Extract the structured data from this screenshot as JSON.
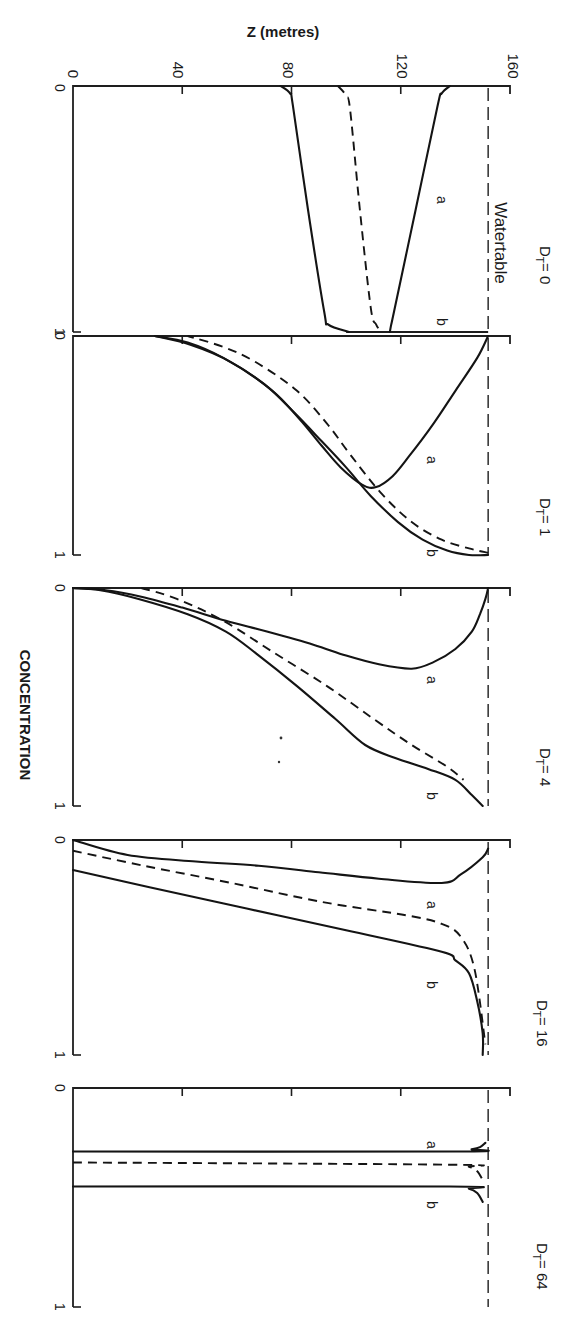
{
  "figure": {
    "z_axis_title": "Z (metres)",
    "z_ticks": [
      "0",
      "40",
      "80",
      "120",
      "160"
    ],
    "concentration_axis_title": "CONCENTRATION",
    "watertable_label": "Watertable",
    "curve_labels": {
      "a": "a",
      "b": "b"
    }
  },
  "chart_data": {
    "type": "line",
    "title": "",
    "layout": "5 stacked panels, figure rotated 90° (Z horizontal, concentration increasing downward)",
    "xlabel": "CONCENTRATION",
    "ylabel": "Z (metres)",
    "xlim": [
      0,
      1
    ],
    "ylim": [
      0,
      160
    ],
    "z_ticks": [
      0,
      40,
      80,
      120,
      160
    ],
    "concentration_ticks": [
      0,
      1
    ],
    "watertable_z": 152,
    "grid": false,
    "legend": "inline curve labels 'a' and 'b'; dashed curve unlabeled",
    "panels": [
      {
        "label": "D_T = 0",
        "label_main": "D",
        "label_sub": "T",
        "label_value": "= 0",
        "series": [
          {
            "name": "a",
            "style": "solid",
            "points": [
              [
                0,
                138
              ],
              [
                0.03,
                135
              ],
              [
                0.08,
                133.5
              ],
              [
                0.5,
                125.5
              ],
              [
                0.92,
                117.5
              ],
              [
                0.97,
                116.5
              ],
              [
                1,
                116
              ]
            ]
          },
          {
            "name": "dashed",
            "style": "dashed",
            "points": [
              [
                0,
                97
              ],
              [
                0.04,
                100
              ],
              [
                0.1,
                101.5
              ],
              [
                0.5,
                105
              ],
              [
                0.9,
                109
              ],
              [
                0.97,
                111
              ],
              [
                1,
                113
              ]
            ]
          },
          {
            "name": "b",
            "style": "solid",
            "points": [
              [
                0,
                76
              ],
              [
                0.03,
                79.5
              ],
              [
                0.08,
                80.5
              ],
              [
                0.5,
                86
              ],
              [
                0.92,
                92
              ],
              [
                0.97,
                93.5
              ],
              [
                1,
                101
              ]
            ]
          }
        ]
      },
      {
        "label": "D_T = 1",
        "label_main": "D",
        "label_sub": "T",
        "label_value": "= 1",
        "series": [
          {
            "name": "a",
            "style": "solid",
            "points": [
              [
                0,
                152
              ],
              [
                0.1,
                148
              ],
              [
                0.25,
                140
              ],
              [
                0.4,
                132
              ],
              [
                0.55,
                123
              ],
              [
                0.64,
                117
              ],
              [
                0.69,
                111
              ],
              [
                0.68,
                106
              ],
              [
                0.6,
                98
              ],
              [
                0.5,
                91
              ],
              [
                0.38,
                83
              ],
              [
                0.25,
                73
              ],
              [
                0.12,
                58
              ],
              [
                0.04,
                43
              ],
              [
                0,
                30
              ]
            ]
          },
          {
            "name": "dashed",
            "style": "dashed",
            "points": [
              [
                0.99,
                152
              ],
              [
                0.97,
                145
              ],
              [
                0.93,
                135
              ],
              [
                0.85,
                124
              ],
              [
                0.72,
                113
              ],
              [
                0.55,
                102
              ],
              [
                0.4,
                93
              ],
              [
                0.25,
                82
              ],
              [
                0.12,
                67
              ],
              [
                0.05,
                55
              ],
              [
                0,
                42
              ]
            ]
          },
          {
            "name": "b",
            "style": "solid",
            "points": [
              [
                1,
                152
              ],
              [
                1,
                145
              ],
              [
                0.98,
                137
              ],
              [
                0.93,
                128
              ],
              [
                0.85,
                119
              ],
              [
                0.73,
                109
              ],
              [
                0.6,
                100
              ],
              [
                0.48,
                91
              ],
              [
                0.35,
                81
              ],
              [
                0.22,
                70
              ],
              [
                0.1,
                55
              ],
              [
                0.03,
                42
              ],
              [
                0,
                30
              ]
            ]
          }
        ]
      },
      {
        "label": "D_T = 4",
        "label_main": "D",
        "label_sub": "T",
        "label_value": "= 4",
        "series": [
          {
            "name": "a",
            "style": "solid",
            "points": [
              [
                0,
                152
              ],
              [
                0.05,
                151
              ],
              [
                0.12,
                149
              ],
              [
                0.2,
                146
              ],
              [
                0.28,
                140
              ],
              [
                0.34,
                132
              ],
              [
                0.37,
                124
              ],
              [
                0.35,
                112
              ],
              [
                0.31,
                100
              ],
              [
                0.26,
                88
              ],
              [
                0.2,
                71
              ],
              [
                0.15,
                56
              ],
              [
                0.09,
                40
              ],
              [
                0.04,
                25
              ],
              [
                0.01,
                12
              ],
              [
                0,
                0
              ]
            ]
          },
          {
            "name": "dashed",
            "style": "dashed",
            "points": [
              [
                0,
                25
              ],
              [
                0.05,
                38
              ],
              [
                0.15,
                55
              ],
              [
                0.3,
                74
              ],
              [
                0.45,
                93
              ],
              [
                0.6,
                110
              ],
              [
                0.72,
                124
              ],
              [
                0.82,
                137
              ],
              [
                0.88,
                143
              ]
            ]
          },
          {
            "name": "b",
            "style": "solid",
            "points": [
              [
                1,
                150
              ],
              [
                0.95,
                146
              ],
              [
                0.88,
                140
              ],
              [
                0.83,
                130
              ],
              [
                0.78,
                118
              ],
              [
                0.72,
                107
              ],
              [
                0.6,
                96
              ],
              [
                0.45,
                82
              ],
              [
                0.3,
                67
              ],
              [
                0.2,
                56
              ],
              [
                0.12,
                42
              ],
              [
                0.05,
                24
              ],
              [
                0.01,
                10
              ],
              [
                0,
                0
              ]
            ]
          }
        ]
      },
      {
        "label": "D_T = 16",
        "label_main": "D",
        "label_sub": "T",
        "label_value": "= 16",
        "series": [
          {
            "name": "a",
            "style": "solid",
            "points": [
              [
                0.04,
                152
              ],
              [
                0.08,
                150
              ],
              [
                0.16,
                142
              ],
              [
                0.2,
                135
              ],
              [
                0.18,
                112
              ],
              [
                0.15,
                90
              ],
              [
                0.12,
                68
              ],
              [
                0.1,
                45
              ],
              [
                0.07,
                20
              ],
              [
                0,
                0
              ]
            ]
          },
          {
            "name": "dashed",
            "style": "dashed",
            "points": [
              [
                0.05,
                0
              ],
              [
                0.12,
                26
              ],
              [
                0.2,
                58
              ],
              [
                0.29,
                92
              ],
              [
                0.35,
                122
              ],
              [
                0.39,
                135
              ],
              [
                0.45,
                142
              ],
              [
                0.6,
                147
              ],
              [
                0.95,
                151
              ]
            ]
          },
          {
            "name": "b",
            "style": "solid",
            "points": [
              [
                0.14,
                0
              ],
              [
                0.22,
                28
              ],
              [
                0.32,
                64
              ],
              [
                0.42,
                100
              ],
              [
                0.52,
                135
              ],
              [
                0.56,
                140
              ],
              [
                0.62,
                145
              ],
              [
                0.75,
                148
              ],
              [
                0.9,
                150
              ],
              [
                1,
                150
              ]
            ]
          }
        ]
      },
      {
        "label": "D_T = 64",
        "label_main": "D",
        "label_sub": "T",
        "label_value": "= 64",
        "series": [
          {
            "name": "a",
            "style": "solid",
            "points": [
              [
                0.29,
                0
              ],
              [
                0.29,
                140
              ],
              [
                0.28,
                146
              ],
              [
                0.27,
                149
              ],
              [
                0.25,
                151
              ]
            ]
          },
          {
            "name": "dashed",
            "style": "dashed",
            "points": [
              [
                0.34,
                0
              ],
              [
                0.35,
                138
              ],
              [
                0.36,
                145
              ],
              [
                0.38,
                148
              ],
              [
                0.42,
                150
              ]
            ]
          },
          {
            "name": "b",
            "style": "solid",
            "points": [
              [
                0.45,
                0
              ],
              [
                0.45,
                138
              ],
              [
                0.46,
                145
              ],
              [
                0.48,
                148
              ],
              [
                0.52,
                150
              ]
            ]
          }
        ]
      }
    ]
  }
}
